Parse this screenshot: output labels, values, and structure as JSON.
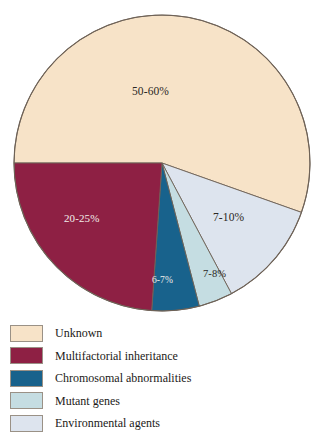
{
  "figure": {
    "name": "causes-of-birth-defects-pie-chart",
    "background_color": "#ffffff"
  },
  "chart_data": {
    "type": "pie",
    "title": "",
    "subtitle": "",
    "xlabel": "",
    "ylabel": "",
    "grid": false,
    "legend_position": "bottom-left",
    "start_angle_deg": 180,
    "direction": "clockwise",
    "center": {
      "x": 162,
      "y": 163
    },
    "radius": 148,
    "outline_color": "#6e6257",
    "slices": [
      {
        "label": "Unknown",
        "value_text": "50-60%",
        "value_min": 50,
        "value_max": 60,
        "drawn_percent": 55.4,
        "sweep_deg": 199.5,
        "color": "#f7e3c8",
        "label_color": "dark"
      },
      {
        "label": "Environmental agents",
        "value_text": "7-10%",
        "value_min": 7,
        "value_max": 10,
        "drawn_percent": 11.8,
        "sweep_deg": 42.5,
        "color": "#dde4ee",
        "label_color": "dark"
      },
      {
        "label": "Mutant genes",
        "value_text": "7-8%",
        "value_min": 7,
        "value_max": 8,
        "drawn_percent": 3.8,
        "sweep_deg": 13.4,
        "color": "#c5dde2",
        "label_color": "dark"
      },
      {
        "label": "Chromosomal abnormalities",
        "value_text": "6-7%",
        "value_min": 6,
        "value_max": 7,
        "drawn_percent": 5.2,
        "sweep_deg": 18.6,
        "color": "#18628c",
        "label_color": "light"
      },
      {
        "label": "Multifactorial inheritance",
        "value_text": "20-25%",
        "value_min": 20,
        "value_max": 25,
        "drawn_percent": 23.9,
        "sweep_deg": 86.0,
        "color": "#8e2044",
        "label_color": "light"
      }
    ],
    "legend": [
      {
        "label": "Unknown",
        "color": "#f7e3c8"
      },
      {
        "label": "Multifactorial inheritance",
        "color": "#8e2044"
      },
      {
        "label": "Chromosomal abnormalities",
        "color": "#18628c"
      },
      {
        "label": "Mutant genes",
        "color": "#c5dde2"
      },
      {
        "label": "Environmental agents",
        "color": "#dde4ee"
      }
    ]
  }
}
